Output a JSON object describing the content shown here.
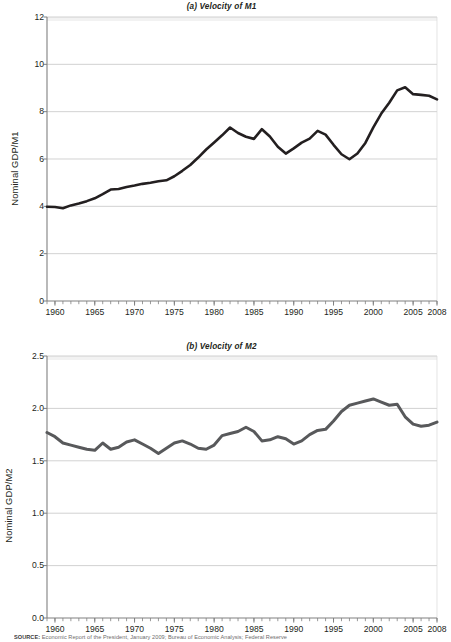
{
  "figure": {
    "source_label": "SOURCE:",
    "source_text": "Economic Report of the President, January 2009; Bureau of Economic Analysis; Federal Reserve"
  },
  "chart_data": [
    {
      "id": "panel-a",
      "type": "line",
      "title": "(a) Velocity of M1",
      "xlabel": "",
      "ylabel": "Nominal GDP/M1",
      "line_color": "#231f20",
      "line_width": 2.6,
      "grid": true,
      "grid_color": "#bfbfbf",
      "axis_color": "#808080",
      "legend": "none",
      "xlim": [
        1959,
        2008
      ],
      "ylim": [
        0,
        12
      ],
      "yticks": [
        0,
        2,
        4,
        6,
        8,
        10,
        12
      ],
      "ytick_labels": [
        "0",
        "2",
        "4",
        "6",
        "8",
        "10",
        "12"
      ],
      "xticks": [
        1960,
        1965,
        1970,
        1975,
        1980,
        1985,
        1990,
        1995,
        2000,
        2005,
        2008
      ],
      "xtick_labels": [
        "1960",
        "1965",
        "1970",
        "1975",
        "1980",
        "1985",
        "1990",
        "1995",
        "2000",
        "2005",
        "2008"
      ],
      "x": [
        1959,
        1960,
        1961,
        1962,
        1963,
        1964,
        1965,
        1966,
        1967,
        1968,
        1969,
        1970,
        1971,
        1972,
        1973,
        1974,
        1975,
        1976,
        1977,
        1978,
        1979,
        1980,
        1981,
        1982,
        1983,
        1984,
        1985,
        1986,
        1987,
        1988,
        1989,
        1990,
        1991,
        1992,
        1993,
        1994,
        1995,
        1996,
        1997,
        1998,
        1999,
        2000,
        2001,
        2002,
        2003,
        2004,
        2005,
        2006,
        2007,
        2008
      ],
      "values": [
        3.98,
        3.97,
        3.92,
        4.04,
        4.12,
        4.22,
        4.34,
        4.52,
        4.71,
        4.73,
        4.82,
        4.88,
        4.95,
        5.0,
        5.06,
        5.1,
        5.27,
        5.5,
        5.75,
        6.06,
        6.4,
        6.7,
        7.0,
        7.33,
        7.1,
        6.94,
        6.85,
        7.26,
        6.95,
        6.52,
        6.23,
        6.45,
        6.69,
        6.86,
        7.19,
        7.03,
        6.6,
        6.2,
        5.99,
        6.23,
        6.68,
        7.34,
        7.92,
        8.38,
        8.9,
        9.03,
        8.74,
        8.71,
        8.67,
        8.52,
        8.6,
        9.24,
        9.7,
        10.05,
        10.08,
        8.93
      ]
    },
    {
      "id": "panel-b",
      "type": "line",
      "title": "(b) Velocity of M2",
      "xlabel": "",
      "ylabel": "Nominal GDP/M2",
      "line_color": "#58595b",
      "line_width": 3.0,
      "grid": true,
      "grid_color": "#bfbfbf",
      "axis_color": "#808080",
      "legend": "none",
      "xlim": [
        1959,
        2008
      ],
      "ylim": [
        0,
        2.5
      ],
      "yticks": [
        0.0,
        0.5,
        1.0,
        1.5,
        2.0,
        2.5
      ],
      "ytick_labels": [
        "0.0",
        "0.5",
        "1.0",
        "1.5",
        "2.0",
        "2.5"
      ],
      "xticks": [
        1960,
        1965,
        1970,
        1975,
        1980,
        1985,
        1990,
        1995,
        2000,
        2005,
        2008
      ],
      "xtick_labels": [
        "1960",
        "1965",
        "1970",
        "1975",
        "1980",
        "1985",
        "1990",
        "1995",
        "2000",
        "2005",
        "2008"
      ],
      "x": [
        1959,
        1960,
        1961,
        1962,
        1963,
        1964,
        1965,
        1966,
        1967,
        1968,
        1969,
        1970,
        1971,
        1972,
        1973,
        1974,
        1975,
        1976,
        1977,
        1978,
        1979,
        1980,
        1981,
        1982,
        1983,
        1984,
        1985,
        1986,
        1987,
        1988,
        1989,
        1990,
        1991,
        1992,
        1993,
        1994,
        1995,
        1996,
        1997,
        1998,
        1999,
        2000,
        2001,
        2002,
        2003,
        2004,
        2005,
        2006,
        2007,
        2008
      ],
      "values": [
        1.77,
        1.73,
        1.67,
        1.65,
        1.63,
        1.61,
        1.6,
        1.67,
        1.61,
        1.63,
        1.68,
        1.7,
        1.66,
        1.62,
        1.57,
        1.62,
        1.67,
        1.69,
        1.66,
        1.62,
        1.61,
        1.65,
        1.74,
        1.76,
        1.78,
        1.82,
        1.78,
        1.69,
        1.7,
        1.73,
        1.71,
        1.66,
        1.69,
        1.75,
        1.79,
        1.8,
        1.88,
        1.97,
        2.03,
        2.05,
        2.07,
        2.09,
        2.06,
        2.03,
        2.04,
        1.92,
        1.85,
        1.83,
        1.84,
        1.87,
        1.89,
        1.92,
        1.94,
        1.92
      ]
    }
  ]
}
